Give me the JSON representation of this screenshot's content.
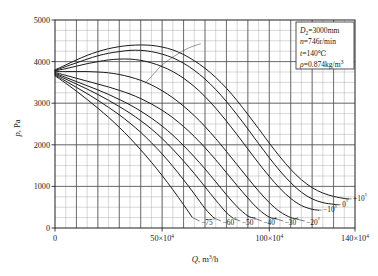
{
  "chart_data": {
    "type": "line",
    "title": "",
    "subtitle": "",
    "xlabel": "Q, m3/h",
    "xlabel_parts": {
      "symbol": "Q",
      "unit_base": ", m",
      "unit_sup": "3",
      "unit_tail": "/h"
    },
    "ylabel": "p, Pa",
    "ylabel_parts": {
      "symbol": "p",
      "unit": ", Pa"
    },
    "xlim": [
      0,
      1400000
    ],
    "ylim": [
      0,
      5000
    ],
    "x_scale_note": "×10⁴",
    "x_major_ticks": [
      0,
      500000,
      1000000,
      1400000
    ],
    "x_tick_labels": [
      "0",
      "50×10⁴",
      "100×10⁴",
      "140×10⁴"
    ],
    "x_minor_step": 50000,
    "y_major_ticks": [
      0,
      1000,
      2000,
      3000,
      4000,
      5000
    ],
    "y_tick_labels": [
      "0",
      "1000",
      "2000",
      "3000",
      "4000",
      "5000"
    ],
    "y_minor_step": 250,
    "grid": true,
    "grid_major_color": "#4a4a4a",
    "grid_minor_color": "#9a9a9a",
    "legend_position": "inline-curve-labels",
    "curve_color": "#1a1a1a",
    "series": [
      {
        "name": "-75°",
        "label": "−75°",
        "label_position": "bottom",
        "x": [
          0,
          50000,
          100000,
          150000,
          200000,
          250000,
          300000,
          350000,
          400000,
          450000,
          500000,
          550000,
          600000,
          640000
        ],
        "y": [
          3660,
          3480,
          3290,
          3090,
          2880,
          2660,
          2420,
          2160,
          1880,
          1580,
          1260,
          920,
          560,
          260
        ]
      },
      {
        "name": "-60°",
        "label": "−60°",
        "label_position": "bottom",
        "x": [
          0,
          50000,
          100000,
          150000,
          200000,
          250000,
          300000,
          350000,
          400000,
          450000,
          500000,
          550000,
          600000,
          650000,
          700000,
          740000
        ],
        "y": [
          3680,
          3530,
          3380,
          3230,
          3070,
          2900,
          2720,
          2520,
          2300,
          2050,
          1780,
          1480,
          1160,
          820,
          470,
          250
        ]
      },
      {
        "name": "-50°",
        "label": "−50°",
        "label_position": "bottom",
        "x": [
          0,
          50000,
          100000,
          150000,
          200000,
          250000,
          300000,
          350000,
          400000,
          450000,
          500000,
          550000,
          600000,
          650000,
          700000,
          750000,
          800000,
          830000
        ],
        "y": [
          3700,
          3580,
          3460,
          3340,
          3210,
          3070,
          2920,
          2760,
          2580,
          2380,
          2150,
          1890,
          1610,
          1310,
          990,
          670,
          370,
          240
        ]
      },
      {
        "name": "-40°",
        "label": "−40°",
        "label_position": "bottom",
        "x": [
          0,
          50000,
          100000,
          150000,
          200000,
          250000,
          300000,
          350000,
          400000,
          450000,
          500000,
          550000,
          600000,
          650000,
          700000,
          750000,
          800000,
          850000,
          900000,
          930000
        ],
        "y": [
          3720,
          3620,
          3520,
          3420,
          3320,
          3210,
          3090,
          2960,
          2810,
          2640,
          2450,
          2230,
          1980,
          1710,
          1420,
          1110,
          800,
          510,
          290,
          240
        ]
      },
      {
        "name": "-30°",
        "label": "−30°",
        "label_position": "bottom",
        "x": [
          0,
          50000,
          100000,
          150000,
          200000,
          250000,
          300000,
          350000,
          400000,
          450000,
          500000,
          550000,
          600000,
          650000,
          700000,
          750000,
          800000,
          850000,
          900000,
          950000,
          1000000,
          1030000
        ],
        "y": [
          3740,
          3670,
          3600,
          3530,
          3460,
          3390,
          3310,
          3220,
          3110,
          2980,
          2830,
          2650,
          2440,
          2200,
          1930,
          1640,
          1330,
          1020,
          720,
          450,
          260,
          230
        ]
      },
      {
        "name": "-20°",
        "label": "−20°",
        "label_position": "bottom",
        "x": [
          0,
          50000,
          100000,
          150000,
          200000,
          250000,
          300000,
          350000,
          400000,
          450000,
          500000,
          550000,
          600000,
          650000,
          700000,
          750000,
          800000,
          850000,
          900000,
          950000,
          1000000,
          1050000,
          1100000,
          1130000
        ],
        "y": [
          3760,
          3760,
          3760,
          3760,
          3750,
          3730,
          3690,
          3630,
          3550,
          3440,
          3300,
          3130,
          2930,
          2700,
          2440,
          2150,
          1840,
          1520,
          1200,
          890,
          610,
          390,
          250,
          220
        ]
      },
      {
        "name": "-10°",
        "label": "−10°",
        "label_position": "right",
        "x": [
          0,
          50000,
          100000,
          150000,
          200000,
          250000,
          300000,
          350000,
          400000,
          450000,
          500000,
          550000,
          600000,
          650000,
          700000,
          750000,
          800000,
          850000,
          900000,
          950000,
          1000000,
          1050000,
          1100000,
          1150000,
          1200000,
          1230000
        ],
        "y": [
          3780,
          3830,
          3890,
          3950,
          4000,
          4040,
          4060,
          4060,
          4030,
          3970,
          3880,
          3760,
          3600,
          3400,
          3160,
          2880,
          2570,
          2240,
          1900,
          1560,
          1240,
          950,
          710,
          540,
          450,
          430
        ]
      },
      {
        "name": "0°",
        "label": "0°",
        "label_position": "right",
        "x": [
          0,
          50000,
          100000,
          150000,
          200000,
          250000,
          300000,
          350000,
          400000,
          450000,
          500000,
          550000,
          600000,
          650000,
          700000,
          750000,
          800000,
          850000,
          900000,
          950000,
          1000000,
          1050000,
          1100000,
          1150000,
          1200000,
          1250000,
          1300000,
          1320000
        ],
        "y": [
          3790,
          3880,
          3970,
          4060,
          4140,
          4200,
          4240,
          4270,
          4270,
          4240,
          4180,
          4090,
          3960,
          3790,
          3580,
          3330,
          3040,
          2720,
          2380,
          2030,
          1690,
          1370,
          1090,
          860,
          700,
          610,
          570,
          560
        ]
      },
      {
        "name": "+10°",
        "label": "+10°",
        "label_position": "right",
        "x": [
          0,
          50000,
          100000,
          150000,
          200000,
          250000,
          300000,
          350000,
          400000,
          450000,
          500000,
          550000,
          600000,
          650000,
          700000,
          750000,
          800000,
          850000,
          900000,
          950000,
          1000000,
          1050000,
          1100000,
          1150000,
          1200000,
          1250000,
          1300000,
          1350000,
          1370000
        ],
        "y": [
          3800,
          3920,
          4040,
          4150,
          4240,
          4310,
          4360,
          4390,
          4400,
          4390,
          4350,
          4280,
          4170,
          4020,
          3840,
          3620,
          3360,
          3060,
          2730,
          2390,
          2040,
          1710,
          1410,
          1160,
          970,
          840,
          760,
          710,
          700
        ]
      }
    ],
    "peak_line": {
      "name": "peak-efficiency-line",
      "x": [
        420000,
        460000,
        500000,
        560000,
        620000,
        680000
      ],
      "y": [
        3480,
        3700,
        3920,
        4140,
        4320,
        4430
      ]
    },
    "annotations": [
      {
        "id": "param-d2",
        "symbol": "D",
        "sub": "2",
        "text": "=3000mm"
      },
      {
        "id": "param-n",
        "symbol": "n",
        "sub": "",
        "text": "=746r/min"
      },
      {
        "id": "param-t",
        "symbol": "t",
        "sub": "",
        "text": "=140℃"
      },
      {
        "id": "param-rho",
        "symbol": "ρ",
        "sub": "",
        "text": "=0.874kg/m",
        "sup": "3"
      }
    ]
  }
}
